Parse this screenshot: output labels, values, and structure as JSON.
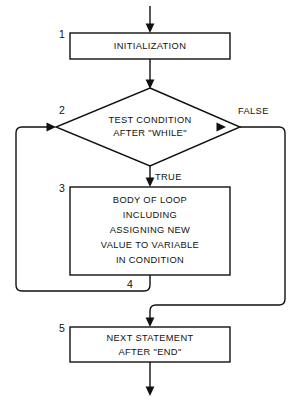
{
  "diagram": {
    "background_color": "#ffffff",
    "line_color": "#111111",
    "shape_fill": "#ffffff"
  },
  "nodes": [
    {
      "id": "initialization",
      "number": "1",
      "shape": "process",
      "lines": [
        "INITIALIZATION"
      ]
    },
    {
      "id": "test-condition",
      "number": "2",
      "shape": "decision",
      "lines": [
        "TEST CONDITION",
        "AFTER \"WHILE\""
      ]
    },
    {
      "id": "body-of-loop",
      "number": "3",
      "shape": "process",
      "lines": [
        "BODY OF LOOP",
        "INCLUDING",
        "ASSIGNING NEW",
        "VALUE TO VARIABLE",
        "IN CONDITION"
      ]
    },
    {
      "id": "loop-back",
      "number": "4",
      "shape": "connector-label",
      "lines": []
    },
    {
      "id": "next-statement",
      "number": "5",
      "shape": "process",
      "lines": [
        "NEXT STATEMENT",
        "AFTER \"END\""
      ]
    }
  ],
  "branch_labels": {
    "true": "TRUE",
    "false": "FALSE"
  }
}
